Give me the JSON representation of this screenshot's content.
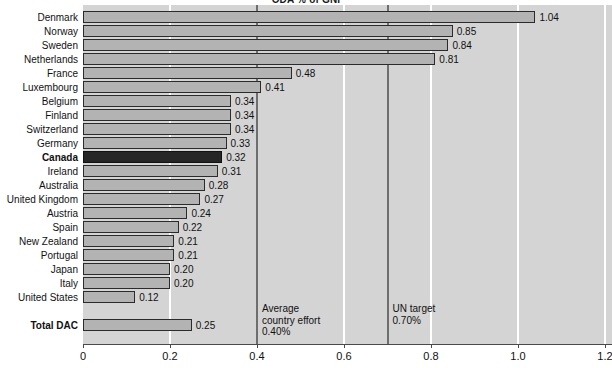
{
  "chart_data": {
    "type": "bar",
    "orientation": "horizontal",
    "title": "ODA % of GNI",
    "xlabel": "",
    "ylabel": "",
    "xlim": [
      0,
      1.2
    ],
    "xticks": [
      "0",
      "0.2",
      "0.4",
      "0.6",
      "0.8",
      "1.0",
      "1.2"
    ],
    "xtick_values": [
      0,
      0.2,
      0.4,
      0.6,
      0.8,
      1.0,
      1.2
    ],
    "grid": "vertical-white-gridlines",
    "legend": "none",
    "categories": [
      "Denmark",
      "Norway",
      "Sweden",
      "Netherlands",
      "France",
      "Luxembourg",
      "Belgium",
      "Finland",
      "Switzerland",
      "Germany",
      "Canada",
      "Ireland",
      "Australia",
      "United Kingdom",
      "Austria",
      "Spain",
      "New Zealand",
      "Portugal",
      "Japan",
      "Italy",
      "United States",
      "Total DAC"
    ],
    "values": [
      1.04,
      0.85,
      0.84,
      0.81,
      0.48,
      0.41,
      0.34,
      0.34,
      0.34,
      0.33,
      0.32,
      0.31,
      0.28,
      0.27,
      0.24,
      0.22,
      0.21,
      0.21,
      0.2,
      0.2,
      0.12,
      0.25
    ],
    "value_labels": [
      "1.04",
      "0.85",
      "0.84",
      "0.81",
      "0.48",
      "0.41",
      "0.34",
      "0.34",
      "0.34",
      "0.33",
      "0.32",
      "0.31",
      "0.28",
      "0.27",
      "0.24",
      "0.22",
      "0.21",
      "0.21",
      "0.20",
      "0.20",
      "0.12",
      "0.25"
    ],
    "highlighted_category": "Canada",
    "summary_category": "Total DAC",
    "bold_categories": [
      "Canada",
      "Total DAC"
    ],
    "annotations": [
      {
        "text_lines": [
          "Average",
          "country effort",
          "0.40%"
        ],
        "value": 0.4
      },
      {
        "text_lines": [
          "UN target",
          "0.70%"
        ],
        "value": 0.7
      }
    ],
    "reference_lines": [
      0.4,
      0.7
    ],
    "colors": {
      "plot_background": "#d4d4d4",
      "bar_fill": "#b3b3b3",
      "bar_border": "#2b2b2b",
      "highlight_fill": "#262626",
      "gridline": "#ffffff",
      "reference_line": "#6e6e6e",
      "text": "#111111"
    }
  }
}
